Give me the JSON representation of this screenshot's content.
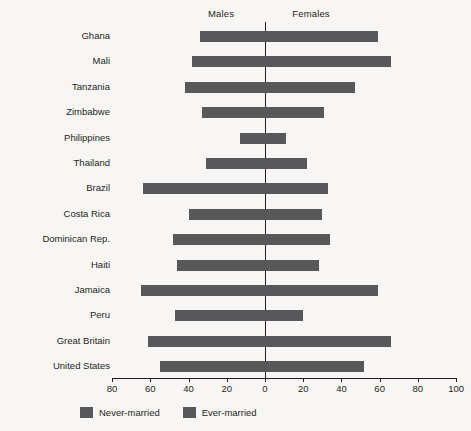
{
  "header": {
    "males_label": "Males",
    "females_label": "Females"
  },
  "legend": {
    "items": [
      {
        "label": "Never-married",
        "color": "#58585a"
      },
      {
        "label": "Ever-married",
        "color": "#58585a"
      }
    ]
  },
  "axis": {
    "tick_labels": [
      "80",
      "60",
      "40",
      "20",
      "0",
      "20",
      "40",
      "60",
      "80",
      "100"
    ],
    "tick_values": [
      -80,
      -60,
      -40,
      -20,
      0,
      20,
      40,
      60,
      80,
      100
    ],
    "min": -80,
    "max": 100,
    "zero_label": "0"
  },
  "chart_data": {
    "type": "bar",
    "orientation": "horizontal-diverging",
    "title": "",
    "subtitle": "",
    "xlabel": "",
    "ylabel": "",
    "xlim": [
      -80,
      100
    ],
    "grid": false,
    "legend_position": "bottom",
    "left_axis_title": "Males",
    "right_axis_title": "Females",
    "categories": [
      "Ghana",
      "Mali",
      "Tanzania",
      "Zimbabwe",
      "Philippines",
      "Thailand",
      "Brazil",
      "Costa Rica",
      "Dominican Rep.",
      "Haiti",
      "Jamaica",
      "Peru",
      "Great Britain",
      "United States"
    ],
    "series": [
      {
        "name": "Males",
        "direction": "left",
        "values": [
          34,
          38,
          42,
          33,
          13,
          31,
          64,
          40,
          48,
          46,
          65,
          47,
          61,
          55
        ]
      },
      {
        "name": "Females",
        "direction": "right",
        "values": [
          59,
          66,
          47,
          31,
          11,
          22,
          33,
          30,
          34,
          28,
          59,
          20,
          66,
          52
        ]
      }
    ],
    "bars": [
      {
        "category": "Ghana",
        "males": 34,
        "females": 59
      },
      {
        "category": "Mali",
        "males": 38,
        "females": 66
      },
      {
        "category": "Tanzania",
        "males": 42,
        "females": 47
      },
      {
        "category": "Zimbabwe",
        "males": 33,
        "females": 31
      },
      {
        "category": "Philippines",
        "males": 13,
        "females": 11
      },
      {
        "category": "Thailand",
        "males": 31,
        "females": 22
      },
      {
        "category": "Brazil",
        "males": 64,
        "females": 33
      },
      {
        "category": "Costa Rica",
        "males": 40,
        "females": 30
      },
      {
        "category": "Dominican Rep.",
        "males": 48,
        "females": 34
      },
      {
        "category": "Haiti",
        "males": 46,
        "females": 28
      },
      {
        "category": "Jamaica",
        "males": 65,
        "females": 59
      },
      {
        "category": "Peru",
        "males": 47,
        "females": 20
      },
      {
        "category": "Great Britain",
        "males": 61,
        "females": 66
      },
      {
        "category": "United States",
        "males": 55,
        "females": 52
      }
    ],
    "bar_color": "#58585a"
  }
}
